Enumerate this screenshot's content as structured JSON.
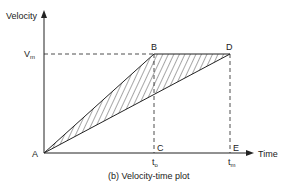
{
  "diagram": {
    "caption": "(b) Velocity-time plot",
    "y_axis_label": "Velocity",
    "x_axis_label": "Time",
    "y_marker": {
      "main": "V",
      "sub": "m"
    },
    "x_markers": [
      {
        "main": "t",
        "sub": "o"
      },
      {
        "main": "t",
        "sub": "m"
      }
    ],
    "points": {
      "A": "A",
      "B": "B",
      "C": "C",
      "D": "D",
      "E": "E"
    },
    "colors": {
      "line": "#222222",
      "background": "#ffffff"
    },
    "shaded_region": "triangle ABD (hatched)"
  }
}
